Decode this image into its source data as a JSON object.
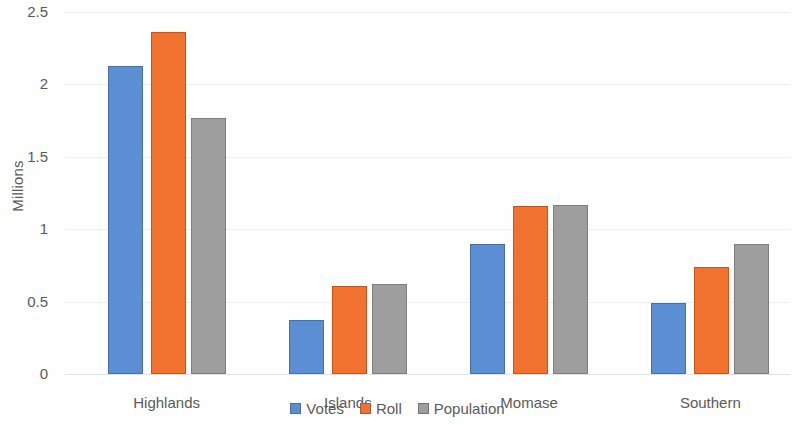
{
  "chart_data": {
    "type": "bar",
    "title": "",
    "subtitle": "",
    "xlabel": "",
    "ylabel": "Millions",
    "categories": [
      "Highlands",
      "Islands",
      "Momase",
      "Southern"
    ],
    "series": [
      {
        "name": "Votes",
        "color": "#5B8FD4",
        "values": [
          2.13,
          0.37,
          0.9,
          0.49
        ]
      },
      {
        "name": "Roll",
        "color": "#F2722F",
        "values": [
          2.36,
          0.61,
          1.16,
          0.74
        ]
      },
      {
        "name": "Population",
        "color": "#9E9E9E",
        "values": [
          1.77,
          0.62,
          1.17,
          0.9
        ]
      }
    ],
    "ylim": [
      0,
      2.5
    ],
    "ytick_labels": [
      "0",
      "0.5",
      "1",
      "1.5",
      "2",
      "2.5"
    ],
    "ytick_values": [
      0,
      0.5,
      1,
      1.5,
      2,
      2.5
    ],
    "grid": true,
    "grid_axis": "y",
    "legend_position": "bottom",
    "legend_entries": [
      "Votes",
      "Roll",
      "Population"
    ],
    "annotations": []
  }
}
